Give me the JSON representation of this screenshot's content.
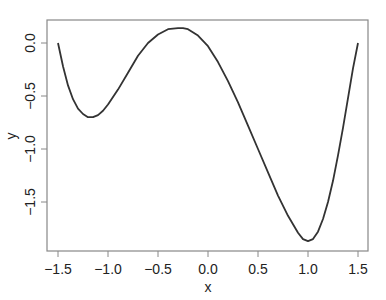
{
  "chart_data": {
    "type": "line",
    "title": "",
    "xlabel": "x",
    "ylabel": "y",
    "xlim": [
      -1.5,
      1.5
    ],
    "ylim": [
      -1.88,
      0.14
    ],
    "x_ticks": [
      -1.5,
      -1.0,
      -0.5,
      0.0,
      0.5,
      1.0,
      1.5
    ],
    "x_tick_labels": [
      "-1.5",
      "-1.0",
      "-0.5",
      "0.0",
      "0.5",
      "1.0",
      "1.5"
    ],
    "y_ticks": [
      0.0,
      -0.5,
      -1.0,
      -1.5
    ],
    "y_tick_labels": [
      "0.0",
      "-0.5",
      "-1.0",
      "-1.5"
    ],
    "grid": false,
    "legend": null,
    "line_color": "#333333",
    "series": [
      {
        "name": "y",
        "x": [
          -1.5,
          -1.45,
          -1.4,
          -1.35,
          -1.3,
          -1.25,
          -1.2,
          -1.15,
          -1.1,
          -1.05,
          -1.0,
          -0.9,
          -0.8,
          -0.7,
          -0.6,
          -0.5,
          -0.4,
          -0.3,
          -0.25,
          -0.2,
          -0.1,
          0.0,
          0.1,
          0.2,
          0.3,
          0.4,
          0.5,
          0.6,
          0.7,
          0.8,
          0.9,
          0.95,
          1.0,
          1.05,
          1.1,
          1.15,
          1.2,
          1.25,
          1.3,
          1.35,
          1.4,
          1.45,
          1.5
        ],
        "y": [
          0.0,
          -0.22,
          -0.4,
          -0.53,
          -0.62,
          -0.67,
          -0.7,
          -0.7,
          -0.68,
          -0.64,
          -0.58,
          -0.44,
          -0.28,
          -0.12,
          0.0,
          0.08,
          0.13,
          0.14,
          0.14,
          0.13,
          0.07,
          -0.03,
          -0.18,
          -0.36,
          -0.56,
          -0.78,
          -1.0,
          -1.22,
          -1.44,
          -1.63,
          -1.79,
          -1.85,
          -1.87,
          -1.85,
          -1.78,
          -1.66,
          -1.5,
          -1.3,
          -1.06,
          -0.8,
          -0.52,
          -0.24,
          0.0
        ]
      }
    ]
  }
}
